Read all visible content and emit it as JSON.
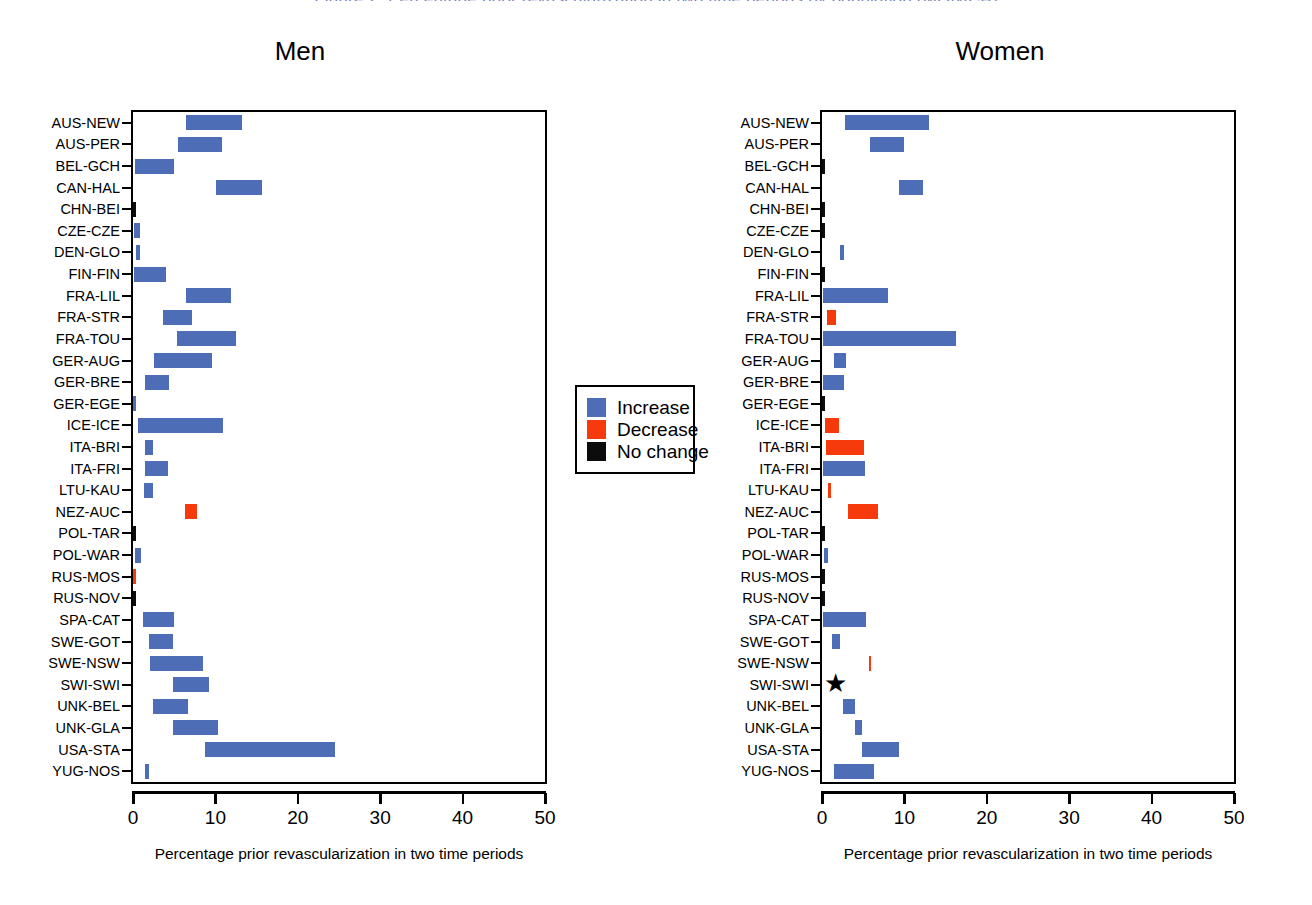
{
  "figure": {
    "clipped_top_title": "Figure 2. Percentage prior revascularization in two time periods by population (MONICA)",
    "categories": [
      "AUS-NEW",
      "AUS-PER",
      "BEL-GCH",
      "CAN-HAL",
      "CHN-BEI",
      "CZE-CZE",
      "DEN-GLO",
      "FIN-FIN",
      "FRA-LIL",
      "FRA-STR",
      "FRA-TOU",
      "GER-AUG",
      "GER-BRE",
      "GER-EGE",
      "ICE-ICE",
      "ITA-BRI",
      "ITA-FRI",
      "LTU-KAU",
      "NEZ-AUC",
      "POL-TAR",
      "POL-WAR",
      "RUS-MOS",
      "RUS-NOV",
      "SPA-CAT",
      "SWE-GOT",
      "SWE-NSW",
      "SWI-SWI",
      "UNK-BEL",
      "UNK-GLA",
      "USA-STA",
      "YUG-NOS"
    ],
    "axis_title": "Percentage prior revascularization in two time periods",
    "x_ticks": [
      "0",
      "10",
      "20",
      "30",
      "40",
      "50"
    ],
    "x_tick_values": [
      0,
      10,
      20,
      30,
      40,
      50
    ],
    "xlim": [
      0,
      50
    ],
    "star_annotation": "★"
  },
  "legend": {
    "items": [
      {
        "label": "Increase",
        "color": "#4d6db7",
        "key": "increase"
      },
      {
        "label": "Decrease",
        "color": "#f73a0c",
        "key": "decrease"
      },
      {
        "label": "No change",
        "color": "#0c0c0c",
        "key": "nochange"
      }
    ]
  },
  "panels": [
    {
      "key": "men",
      "title": "Men"
    },
    {
      "key": "women",
      "title": "Women"
    }
  ],
  "chart_data": {
    "type": "bar",
    "subtype": "floating-range-bar",
    "title": "Percentage prior revascularization in two time periods by population",
    "xlabel": "Percentage prior revascularization in two time periods",
    "ylabel": "",
    "xlim": [
      0,
      50
    ],
    "xticks": [
      0,
      10,
      20,
      30,
      40,
      50
    ],
    "grid": false,
    "legend_position": "center",
    "legend": [
      "Increase",
      "Decrease",
      "No change"
    ],
    "colors": {
      "increase": "#4d6db7",
      "decrease": "#f73a0c",
      "nochange": "#0c0c0c"
    },
    "categories": [
      "AUS-NEW",
      "AUS-PER",
      "BEL-GCH",
      "CAN-HAL",
      "CHN-BEI",
      "CZE-CZE",
      "DEN-GLO",
      "FIN-FIN",
      "FRA-LIL",
      "FRA-STR",
      "FRA-TOU",
      "GER-AUG",
      "GER-BRE",
      "GER-EGE",
      "ICE-ICE",
      "ITA-BRI",
      "ITA-FRI",
      "LTU-KAU",
      "NEZ-AUC",
      "POL-TAR",
      "POL-WAR",
      "RUS-MOS",
      "RUS-NOV",
      "SPA-CAT",
      "SWE-GOT",
      "SWE-NSW",
      "SWI-SWI",
      "UNK-BEL",
      "UNK-GLA",
      "USA-STA",
      "YUG-NOS"
    ],
    "series": [
      {
        "name": "Men",
        "bars": [
          {
            "category": "AUS-NEW",
            "start": 6.4,
            "end": 13.2,
            "type": "increase"
          },
          {
            "category": "AUS-PER",
            "start": 5.5,
            "end": 10.8,
            "type": "increase"
          },
          {
            "category": "BEL-GCH",
            "start": 0.2,
            "end": 5.0,
            "type": "increase"
          },
          {
            "category": "CAN-HAL",
            "start": 10.1,
            "end": 15.6,
            "type": "increase"
          },
          {
            "category": "CHN-BEI",
            "start": 0.0,
            "end": 0.2,
            "type": "nochange"
          },
          {
            "category": "CZE-CZE",
            "start": 0.1,
            "end": 0.8,
            "type": "increase"
          },
          {
            "category": "DEN-GLO",
            "start": 0.4,
            "end": 0.9,
            "type": "increase"
          },
          {
            "category": "FIN-FIN",
            "start": 0.1,
            "end": 4.0,
            "type": "increase"
          },
          {
            "category": "FRA-LIL",
            "start": 6.4,
            "end": 11.9,
            "type": "increase"
          },
          {
            "category": "FRA-STR",
            "start": 3.7,
            "end": 7.2,
            "type": "increase"
          },
          {
            "category": "FRA-TOU",
            "start": 5.4,
            "end": 12.5,
            "type": "increase"
          },
          {
            "category": "GER-AUG",
            "start": 2.6,
            "end": 9.6,
            "type": "increase"
          },
          {
            "category": "GER-BRE",
            "start": 1.4,
            "end": 4.4,
            "type": "increase"
          },
          {
            "category": "GER-EGE",
            "start": 0.0,
            "end": 0.4,
            "type": "increase"
          },
          {
            "category": "ICE-ICE",
            "start": 0.6,
            "end": 10.9,
            "type": "increase"
          },
          {
            "category": "ITA-BRI",
            "start": 1.4,
            "end": 2.4,
            "type": "increase"
          },
          {
            "category": "ITA-FRI",
            "start": 1.5,
            "end": 4.3,
            "type": "increase"
          },
          {
            "category": "LTU-KAU",
            "start": 1.3,
            "end": 2.4,
            "type": "increase"
          },
          {
            "category": "NEZ-AUC",
            "start": 6.3,
            "end": 7.8,
            "type": "decrease"
          },
          {
            "category": "POL-TAR",
            "start": 0.0,
            "end": 0.2,
            "type": "nochange"
          },
          {
            "category": "POL-WAR",
            "start": 0.3,
            "end": 1.0,
            "type": "increase"
          },
          {
            "category": "RUS-MOS",
            "start": 0.0,
            "end": 0.2,
            "type": "decrease"
          },
          {
            "category": "RUS-NOV",
            "start": 0.0,
            "end": 0.2,
            "type": "nochange"
          },
          {
            "category": "SPA-CAT",
            "start": 1.2,
            "end": 5.0,
            "type": "increase"
          },
          {
            "category": "SWE-GOT",
            "start": 1.9,
            "end": 4.8,
            "type": "increase"
          },
          {
            "category": "SWE-NSW",
            "start": 2.1,
            "end": 8.5,
            "type": "increase"
          },
          {
            "category": "SWI-SWI",
            "start": 4.9,
            "end": 9.2,
            "type": "increase"
          },
          {
            "category": "UNK-BEL",
            "start": 2.4,
            "end": 6.7,
            "type": "increase"
          },
          {
            "category": "UNK-GLA",
            "start": 4.8,
            "end": 10.3,
            "type": "increase"
          },
          {
            "category": "USA-STA",
            "start": 8.7,
            "end": 24.5,
            "type": "increase"
          },
          {
            "category": "YUG-NOS",
            "start": 1.4,
            "end": 2.0,
            "type": "increase"
          }
        ]
      },
      {
        "name": "Women",
        "bars": [
          {
            "category": "AUS-NEW",
            "start": 2.8,
            "end": 13.0,
            "type": "increase"
          },
          {
            "category": "AUS-PER",
            "start": 5.8,
            "end": 10.0,
            "type": "increase"
          },
          {
            "category": "BEL-GCH",
            "start": 0.0,
            "end": 0.3,
            "type": "nochange"
          },
          {
            "category": "CAN-HAL",
            "start": 9.4,
            "end": 12.2,
            "type": "increase"
          },
          {
            "category": "CHN-BEI",
            "start": 0.0,
            "end": 0.3,
            "type": "nochange"
          },
          {
            "category": "CZE-CZE",
            "start": 0.0,
            "end": 0.3,
            "type": "nochange"
          },
          {
            "category": "DEN-GLO",
            "start": 2.2,
            "end": 2.7,
            "type": "increase"
          },
          {
            "category": "FIN-FIN",
            "start": 0.0,
            "end": 0.3,
            "type": "nochange"
          },
          {
            "category": "FRA-LIL",
            "start": 0.1,
            "end": 8.0,
            "type": "increase"
          },
          {
            "category": "FRA-STR",
            "start": 0.6,
            "end": 1.7,
            "type": "decrease"
          },
          {
            "category": "FRA-TOU",
            "start": 0.1,
            "end": 16.3,
            "type": "increase"
          },
          {
            "category": "GER-AUG",
            "start": 1.4,
            "end": 2.9,
            "type": "increase"
          },
          {
            "category": "GER-BRE",
            "start": 0.1,
            "end": 2.7,
            "type": "increase"
          },
          {
            "category": "GER-EGE",
            "start": 0.0,
            "end": 0.3,
            "type": "nochange"
          },
          {
            "category": "ICE-ICE",
            "start": 0.4,
            "end": 2.1,
            "type": "decrease"
          },
          {
            "category": "ITA-BRI",
            "start": 0.5,
            "end": 5.1,
            "type": "decrease"
          },
          {
            "category": "ITA-FRI",
            "start": 0.1,
            "end": 5.2,
            "type": "increase"
          },
          {
            "category": "LTU-KAU",
            "start": 0.7,
            "end": 1.1,
            "type": "decrease"
          },
          {
            "category": "NEZ-AUC",
            "start": 3.1,
            "end": 6.8,
            "type": "decrease"
          },
          {
            "category": "POL-TAR",
            "start": 0.0,
            "end": 0.3,
            "type": "nochange"
          },
          {
            "category": "POL-WAR",
            "start": 0.2,
            "end": 0.7,
            "type": "increase"
          },
          {
            "category": "RUS-MOS",
            "start": 0.0,
            "end": 0.3,
            "type": "nochange"
          },
          {
            "category": "RUS-NOV",
            "start": 0.0,
            "end": 0.3,
            "type": "nochange"
          },
          {
            "category": "SPA-CAT",
            "start": 0.1,
            "end": 5.4,
            "type": "increase"
          },
          {
            "category": "SWE-GOT",
            "start": 1.2,
            "end": 2.2,
            "type": "increase"
          },
          {
            "category": "SWE-NSW",
            "start": 5.7,
            "end": 6.0,
            "type": "decrease"
          },
          {
            "category": "SWI-SWI",
            "start": null,
            "end": null,
            "type": "star"
          },
          {
            "category": "UNK-BEL",
            "start": 2.6,
            "end": 4.0,
            "type": "increase"
          },
          {
            "category": "UNK-GLA",
            "start": 4.0,
            "end": 4.8,
            "type": "increase"
          },
          {
            "category": "USA-STA",
            "start": 4.9,
            "end": 9.4,
            "type": "increase"
          },
          {
            "category": "YUG-NOS",
            "start": 1.4,
            "end": 6.3,
            "type": "increase"
          }
        ]
      }
    ]
  }
}
